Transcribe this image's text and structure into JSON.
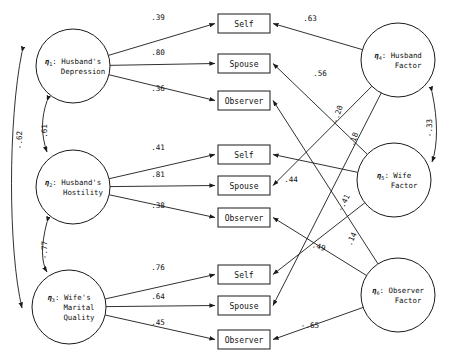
{
  "figure": {
    "type": "path-diagram",
    "title": "",
    "background": "#ffffff",
    "line_color": "#1a1a1a"
  },
  "latent_variables": [
    {
      "id": "eta1",
      "eta": "η",
      "subscript": "1",
      "sep": ":",
      "line1": "Husband's",
      "line2": "Depression",
      "line3": "",
      "cx": 73,
      "cy": 66,
      "r": 37
    },
    {
      "id": "eta2",
      "eta": "η",
      "subscript": "2",
      "sep": ":",
      "line1": "Husband's",
      "line2": "Hostility",
      "line3": "",
      "cx": 73,
      "cy": 187,
      "r": 37
    },
    {
      "id": "eta3",
      "eta": "η",
      "subscript": "3",
      "sep": ":",
      "line1": "Wife's",
      "line2": "Marital",
      "line3": "Quality",
      "cx": 69,
      "cy": 307,
      "r": 37
    },
    {
      "id": "eta4",
      "eta": "η",
      "subscript": "4",
      "sep": ":",
      "line1": "Husband",
      "line2": "Factor",
      "line3": "",
      "cx": 398,
      "cy": 60,
      "r": 37
    },
    {
      "id": "eta5",
      "eta": "η",
      "subscript": "5",
      "sep": ":",
      "line1": "Wife",
      "line2": "Factor",
      "line3": "",
      "cx": 394,
      "cy": 180,
      "r": 37
    },
    {
      "id": "eta6",
      "eta": "η",
      "subscript": "6",
      "sep": ":",
      "line1": "Observer",
      "line2": "Factor",
      "line3": "",
      "cx": 398,
      "cy": 295,
      "r": 37
    }
  ],
  "indicators": [
    {
      "id": "y1",
      "label": "Self",
      "x": 218,
      "y": 14,
      "w": 52,
      "h": 19
    },
    {
      "id": "y2",
      "label": "Spouse",
      "x": 218,
      "y": 54,
      "w": 52,
      "h": 19
    },
    {
      "id": "y3",
      "label": "Observer",
      "x": 218,
      "y": 91,
      "w": 52,
      "h": 19
    },
    {
      "id": "y4",
      "label": "Self",
      "x": 218,
      "y": 145,
      "w": 52,
      "h": 19
    },
    {
      "id": "y5",
      "label": "Spouse",
      "x": 218,
      "y": 176,
      "w": 52,
      "h": 19
    },
    {
      "id": "y6",
      "label": "Observer",
      "x": 218,
      "y": 208,
      "w": 52,
      "h": 19
    },
    {
      "id": "y7",
      "label": "Self",
      "x": 218,
      "y": 265,
      "w": 52,
      "h": 19
    },
    {
      "id": "y8",
      "label": "Spouse",
      "x": 218,
      "y": 296,
      "w": 52,
      "h": 19
    },
    {
      "id": "y9",
      "label": "Observer",
      "x": 218,
      "y": 330,
      "w": 52,
      "h": 19
    }
  ],
  "paths": [
    {
      "id": "p1",
      "from": "eta1",
      "to": "y1",
      "coefficient": ".39",
      "lx": 158,
      "ly": 20,
      "rot": 0
    },
    {
      "id": "p2",
      "from": "eta1",
      "to": "y2",
      "coefficient": ".80",
      "lx": 158,
      "ly": 55,
      "rot": 0
    },
    {
      "id": "p3",
      "from": "eta1",
      "to": "y3",
      "coefficient": ".36",
      "lx": 158,
      "ly": 91,
      "rot": 0
    },
    {
      "id": "p4",
      "from": "eta2",
      "to": "y4",
      "coefficient": ".41",
      "lx": 158,
      "ly": 150,
      "rot": 0
    },
    {
      "id": "p5",
      "from": "eta2",
      "to": "y5",
      "coefficient": ".81",
      "lx": 158,
      "ly": 177,
      "rot": 0
    },
    {
      "id": "p6",
      "from": "eta2",
      "to": "y6",
      "coefficient": ".38",
      "lx": 158,
      "ly": 208,
      "rot": 0
    },
    {
      "id": "p7",
      "from": "eta3",
      "to": "y7",
      "coefficient": ".76",
      "lx": 158,
      "ly": 270,
      "rot": 0
    },
    {
      "id": "p8",
      "from": "eta3",
      "to": "y8",
      "coefficient": ".64",
      "lx": 158,
      "ly": 299,
      "rot": 0
    },
    {
      "id": "p9",
      "from": "eta3",
      "to": "y9",
      "coefficient": ".45",
      "lx": 158,
      "ly": 325,
      "rot": 0
    },
    {
      "id": "p10",
      "from": "eta4",
      "to": "y1",
      "coefficient": ".63",
      "lx": 310,
      "ly": 21,
      "rot": 0
    },
    {
      "id": "p11",
      "from": "eta4",
      "to": "y5",
      "coefficient": ".56",
      "lx": 320,
      "ly": 76,
      "rot": 0
    },
    {
      "id": "p12",
      "from": "eta4",
      "to": "y8",
      "coefficient": "-.20",
      "lx": 340,
      "ly": 115,
      "rot": -72
    },
    {
      "id": "p13",
      "from": "eta5",
      "to": "y2",
      "coefficient": ".18",
      "lx": 356,
      "ly": 140,
      "rot": -70
    },
    {
      "id": "p14",
      "from": "eta5",
      "to": "y4",
      "coefficient": ".44",
      "lx": 291,
      "ly": 182,
      "rot": 0
    },
    {
      "id": "p15",
      "from": "eta5",
      "to": "y7",
      "coefficient": "-.41",
      "lx": 346,
      "ly": 204,
      "rot": -63
    },
    {
      "id": "p16",
      "from": "eta6",
      "to": "y3",
      "coefficient": ".49",
      "lx": 318,
      "ly": 249,
      "rot": 16
    },
    {
      "id": "p17",
      "from": "eta6",
      "to": "y6",
      "coefficient": ".14",
      "lx": 354,
      "ly": 240,
      "rot": -66
    },
    {
      "id": "p18",
      "from": "eta6",
      "to": "y9",
      "coefficient": "-.65",
      "lx": 310,
      "ly": 328,
      "rot": 0
    }
  ],
  "correlations": [
    {
      "id": "c1",
      "between": [
        "eta1",
        "eta2"
      ],
      "coefficient": ".61",
      "lx": 47,
      "ly": 131,
      "rot": -90
    },
    {
      "id": "c2",
      "between": [
        "eta1",
        "eta3"
      ],
      "coefficient": "-.62",
      "lx": 22,
      "ly": 140,
      "rot": -90
    },
    {
      "id": "c3",
      "between": [
        "eta2",
        "eta3"
      ],
      "coefficient": "-.77",
      "lx": 47,
      "ly": 250,
      "rot": -90
    },
    {
      "id": "c4",
      "between": [
        "eta4",
        "eta5"
      ],
      "coefficient": "-.33",
      "lx": 432,
      "ly": 128,
      "rot": -90
    }
  ]
}
